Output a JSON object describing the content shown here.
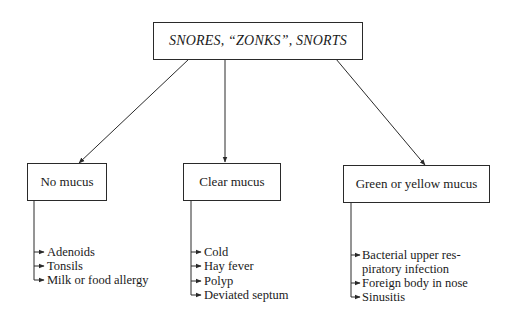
{
  "diagram": {
    "root": {
      "label": "SNORES, “ZONKS”, SNORTS"
    },
    "branches": [
      {
        "label": "No mucus",
        "causes": [
          "Adenoids",
          "Tonsils",
          "Milk or food allergy"
        ]
      },
      {
        "label": "Clear mucus",
        "causes": [
          "Cold",
          "Hay fever",
          "Polyp",
          "Deviated septum"
        ]
      },
      {
        "label": "Green or yellow mucus",
        "causes": [
          "Bacterial upper res-",
          "piratory infection",
          "Foreign body in nose",
          "Sinusitis"
        ]
      }
    ]
  },
  "colors": {
    "line": "#2a2a2a",
    "background": "#ffffff",
    "text": "#1a1a1a"
  }
}
